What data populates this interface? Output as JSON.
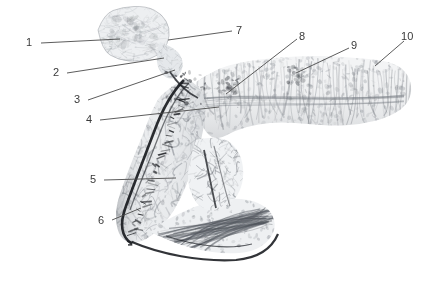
{
  "figure": {
    "type": "anatomical-specimen-photograph",
    "background_color": "#ffffff",
    "width": 441,
    "height": 290,
    "leader_line_color": "#4a4a4a",
    "label_text_color": "#3a3a3a",
    "label_font_size_px": 11
  },
  "labels": [
    {
      "id": "1",
      "text": "1",
      "tx": 26,
      "ty": 37,
      "x1": 41,
      "y1": 43,
      "x2": 120,
      "y2": 39
    },
    {
      "id": "2",
      "text": "2",
      "tx": 53,
      "ty": 67,
      "x1": 67,
      "y1": 73,
      "x2": 164,
      "y2": 58
    },
    {
      "id": "3",
      "text": "3",
      "tx": 74,
      "ty": 94,
      "x1": 88,
      "y1": 100,
      "x2": 175,
      "y2": 70
    },
    {
      "id": "4",
      "text": "4",
      "tx": 86,
      "ty": 114,
      "x1": 100,
      "y1": 120,
      "x2": 219,
      "y2": 107
    },
    {
      "id": "5",
      "text": "5",
      "tx": 90,
      "ty": 174,
      "x1": 104,
      "y1": 180,
      "x2": 176,
      "y2": 178
    },
    {
      "id": "6",
      "text": "6",
      "tx": 98,
      "ty": 215,
      "x1": 112,
      "y1": 220,
      "x2": 141,
      "y2": 208
    },
    {
      "id": "7",
      "text": "7",
      "tx": 236,
      "ty": 25,
      "x1": 232,
      "y1": 31,
      "x2": 168,
      "y2": 40
    },
    {
      "id": "8",
      "text": "8",
      "tx": 299,
      "ty": 31,
      "x1": 297,
      "y1": 39,
      "x2": 226,
      "y2": 94
    },
    {
      "id": "9",
      "text": "9",
      "tx": 351,
      "ty": 40,
      "x1": 349,
      "y1": 48,
      "x2": 296,
      "y2": 73
    },
    {
      "id": "10",
      "text": "10",
      "tx": 401,
      "ty": 31,
      "x1": 404,
      "y1": 41,
      "x2": 375,
      "y2": 66
    }
  ]
}
